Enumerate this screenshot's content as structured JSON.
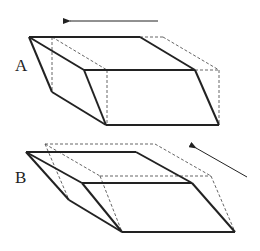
{
  "figure": {
    "panels": [
      {
        "label": "A",
        "description": "box sheared horizontally; solid = deformed shape, dashed = original",
        "arrow_direction": "left"
      },
      {
        "label": "B",
        "description": "box sheared obliquely; solid = deformed shape, dashed = original",
        "arrow_direction": "up-left"
      }
    ],
    "colors": {
      "stroke": "#222222",
      "dashed": "#555555",
      "background": "#ffffff"
    }
  }
}
